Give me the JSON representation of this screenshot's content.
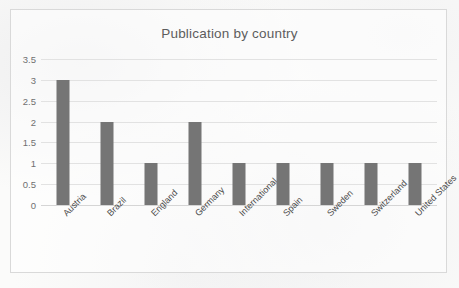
{
  "chart_data": {
    "type": "bar",
    "title": "Publication by country",
    "xlabel": "",
    "ylabel": "",
    "categories": [
      "Austria",
      "Brazil",
      "England",
      "Germany",
      "International",
      "Spain",
      "Sweden",
      "Switzerland",
      "United States"
    ],
    "values": [
      3,
      2,
      1,
      2,
      1,
      1,
      1,
      1,
      1
    ],
    "yticks": [
      "0",
      "0.5",
      "1",
      "1.5",
      "2",
      "2.5",
      "3",
      "3.5"
    ],
    "ytick_values": [
      0,
      0.5,
      1,
      1.5,
      2,
      2.5,
      3,
      3.5
    ],
    "ylim": [
      0,
      3.5
    ],
    "grid": true,
    "legend": false,
    "bar_color": "#757575",
    "gridline_color": "#e2e2e2",
    "title_color": "#5d5d5d",
    "tick_color": "#707070",
    "label_color": "#4a4a4a",
    "border_color": "#d9d9d9",
    "background_color": "#fbfbfa",
    "xlabel_rotation": -45
  }
}
